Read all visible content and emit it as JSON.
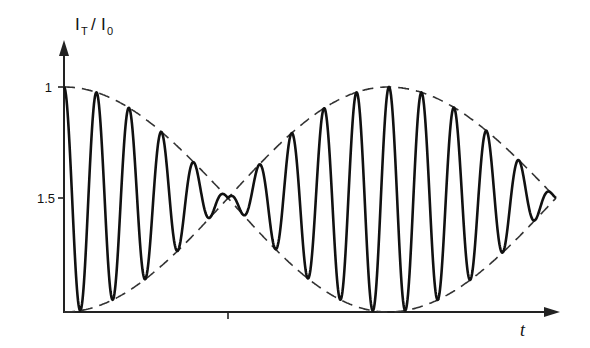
{
  "chart_data": {
    "type": "line",
    "title": "",
    "ylabel": "I_T / I_0",
    "ylabel_parts": {
      "main1": "I",
      "sub1": "T",
      "slash": "/",
      "main2": "I",
      "sub2": "0"
    },
    "xlabel": "t",
    "yticks": [
      {
        "label": "1",
        "y_px": 87
      },
      {
        "label": "1.5",
        "y_px": 198
      }
    ],
    "xticks": [
      {
        "label": "",
        "x_px": 228
      }
    ],
    "series": [
      {
        "name": "transmitted intensity (oscillation)",
        "style": "solid",
        "description": "fast oscillation between upper and lower envelope, beat pattern"
      },
      {
        "name": "upper envelope",
        "style": "dashed"
      },
      {
        "name": "lower envelope",
        "style": "dashed"
      }
    ],
    "beat_pattern": {
      "carrier_period_px": 32.5,
      "envelope_max_at_x_px": [
        64,
        388
      ],
      "envelope_node_at_x_px": [
        228,
        556
      ],
      "upper_envelope_top_y_px": 87,
      "lower_envelope_bottom_y_px": 312,
      "node_y_px": 198
    },
    "grid": false,
    "legend": null
  },
  "axes": {
    "y_arrow": true,
    "x_arrow": true
  }
}
